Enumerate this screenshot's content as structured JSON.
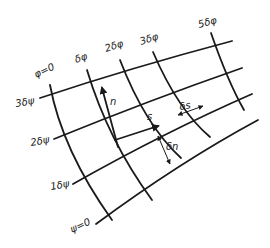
{
  "diagram": {
    "type": "flow-net grid",
    "stream_lines": [
      {
        "id": "psi-3",
        "label": "3δψ"
      },
      {
        "id": "psi-2",
        "label": "2δψ"
      },
      {
        "id": "psi-1",
        "label": "1δψ"
      },
      {
        "id": "psi-0",
        "label": "ψ=0"
      }
    ],
    "potential_lines": [
      {
        "id": "phi-0",
        "label": "φ=0"
      },
      {
        "id": "phi-1",
        "label": "δφ"
      },
      {
        "id": "phi-2",
        "label": "2δφ"
      },
      {
        "id": "phi-3",
        "label": "3δφ"
      },
      {
        "id": "phi-5",
        "label": "5δφ"
      }
    ],
    "vectors": {
      "n_label": "n",
      "s_label": "s"
    },
    "dimensions": {
      "ds_label": "δs",
      "dn_label": "δn"
    }
  }
}
